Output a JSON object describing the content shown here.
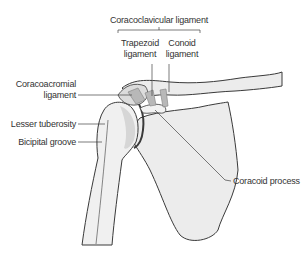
{
  "diagram": {
    "labels": {
      "coracoclavicular": "Coracoclavicular ligament",
      "trapezoid_line1": "Trapezoid",
      "trapezoid_line2": "ligament",
      "conoid_line1": "Conoid",
      "conoid_line2": "ligament",
      "coracoacromial_line1": "Coracoacromial",
      "coracoacromial_line2": "ligament",
      "lesser_tuberosity": "Lesser tuberosity",
      "bicipital_groove": "Bicipital groove",
      "coracoid_process": "Coracoid process"
    },
    "colors": {
      "bone_fill": "#ececec",
      "bone_shade": "#d6d6d6",
      "outline": "#3a3a3a",
      "ligament": "#8a8a8a",
      "leader_line": "#444444",
      "text": "#333333"
    }
  }
}
